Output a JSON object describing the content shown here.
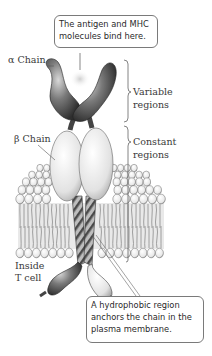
{
  "diagram": {
    "callouts": {
      "top": [
        "The antigen and MHC",
        "molecules bind here."
      ],
      "bottom": [
        "A hydrophobic region",
        "anchors the chain in the",
        "plasma membrane."
      ]
    },
    "labels": {
      "alpha_chain": "α Chain",
      "beta_chain": "β Chain",
      "inside_line1": "Inside",
      "inside_line2": "T cell",
      "variable_line1": "Variable",
      "variable_line2": "regions",
      "constant_line1": "Constant",
      "constant_line2": "regions"
    },
    "colors": {
      "dark_domain": "#5a5a5a",
      "light_domain": "#e6e6e6",
      "membrane_head": "#f2f2f2",
      "binding_site": "#d9d9d9"
    }
  }
}
